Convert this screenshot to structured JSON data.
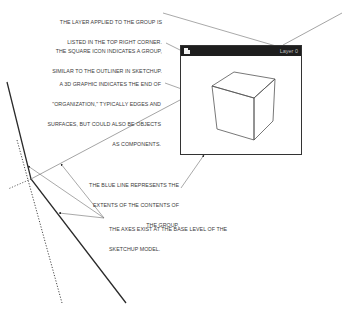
{
  "annotations": {
    "layer_note": [
      "THE LAYER APPLIED TO THE GROUP IS",
      "LISTED IN THE TOP RIGHT CORNER."
    ],
    "square_icon_note": [
      "THE SQUARE ICON INDICATES A GROUP,",
      "SIMILAR TO THE OUTLINER IN SKETCHUP."
    ],
    "graphic_note": [
      "A 3D GRAPHIC INDICATES THE END OF",
      "\"ORGANIZATION,\" TYPICALLY EDGES AND",
      "SURFACES, BUT COULD ALSO BE OBJECTS",
      "AS COMPONENTS."
    ],
    "blue_line_note": [
      "THE BLUE LINE REPRESENTS THE",
      "EXTENTS OF THE CONTENTS OF",
      "THE GROUP."
    ],
    "axes_note": [
      "THE AXES EXIST AT THE BASE LEVEL OF THE",
      "SKETCHUP MODEL."
    ]
  },
  "group_window": {
    "icon": "square-group-icon",
    "layer_label": "Layer 0",
    "header_color": "#1e1e1e",
    "content": "3d-cube"
  },
  "colors": {
    "axis_solid": "#2b2b2b",
    "axis_dotted": "#333333",
    "extent_line": "#9a9a9a",
    "leader": "#6e6e6e"
  }
}
